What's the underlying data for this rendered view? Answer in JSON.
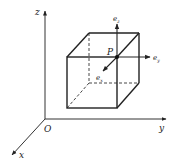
{
  "diagram": {
    "type": "3d-cube-coordinate-system",
    "axes": {
      "x_label": "x",
      "y_label": "y",
      "z_label": "z",
      "origin_label": "O"
    },
    "point": {
      "label": "P"
    },
    "unit_vectors": {
      "ex": "e",
      "ex_sub": "x",
      "ey": "e",
      "ey_sub": "y",
      "ez": "e",
      "ez_sub": "z"
    },
    "colors": {
      "stroke": "#222222",
      "background": "#ffffff"
    }
  }
}
